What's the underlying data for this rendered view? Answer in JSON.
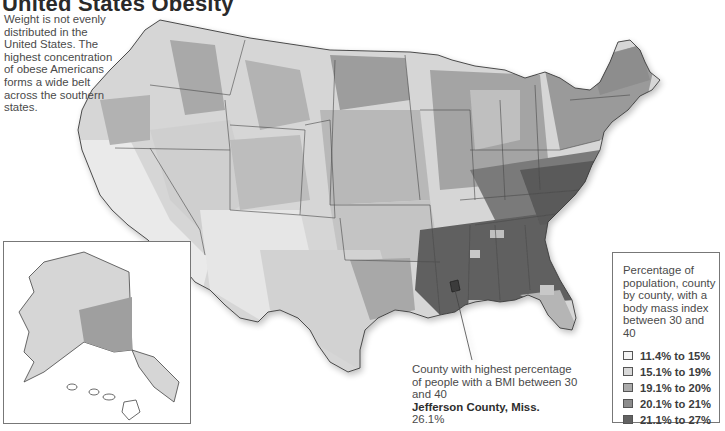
{
  "title": "United States Obesity",
  "intro": "Weight is not evenly distributed in the United States. The highest concentration of obese Americans forms a wide belt across the southern states.",
  "legend": {
    "title": "Percentage of population, county by county, with a body mass index between 30 and 40",
    "items": [
      {
        "label": "11.4% to 15%",
        "color": "#f4f4f4"
      },
      {
        "label": "15.1% to 19%",
        "color": "#d9d9d9"
      },
      {
        "label": "19.1% to 20%",
        "color": "#ababab"
      },
      {
        "label": "20.1% to 21%",
        "color": "#8c8c8c"
      },
      {
        "label": "21.1% to 27%",
        "color": "#626262"
      }
    ]
  },
  "callout": {
    "text": "County with highest percentage of people with a BMI between 30 and 40",
    "county": "Jefferson County, Miss.",
    "value": "26.1%"
  },
  "insets": [
    "Alaska",
    "Hawaii"
  ]
}
